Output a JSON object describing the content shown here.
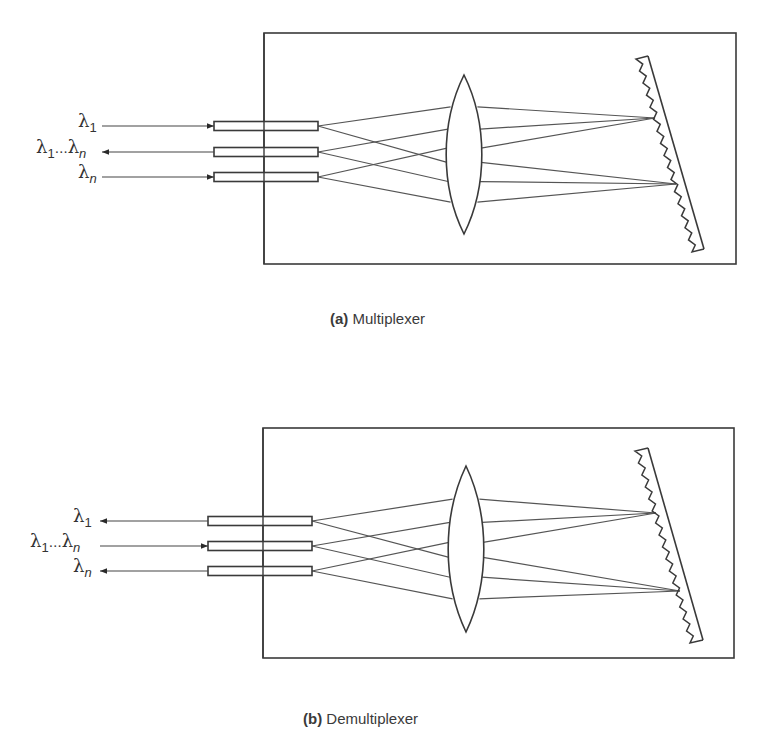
{
  "panels": [
    {
      "id": "a",
      "caption_letter": "(a)",
      "caption_text": "Multiplexer",
      "box": {
        "x": 264,
        "y": 33,
        "w": 472,
        "h": 231
      },
      "fiber": {
        "x1": 214,
        "x2": 318,
        "h": 9,
        "ys": [
          126,
          152,
          177
        ]
      },
      "center_line_x": 264,
      "lens": {
        "cx": 464,
        "top": 75,
        "bottom": 234,
        "half_w": 18
      },
      "grating": {
        "back": [
          [
            648,
            56
          ],
          [
            704,
            249
          ]
        ],
        "front": [
          [
            636,
            59
          ],
          [
            692,
            252
          ]
        ],
        "teeth": 16
      },
      "focus_points": [
        [
          655,
          118
        ],
        [
          676,
          184
        ]
      ],
      "ports": [
        {
          "label": "λ",
          "sub": "1",
          "sub2": "",
          "y": 126,
          "direction": "in"
        },
        {
          "label": "λ",
          "sub": "1",
          "sub2": "n",
          "y": 152,
          "direction": "out"
        },
        {
          "label": "λ",
          "sub": "n",
          "sub2": "",
          "y": 177,
          "direction": "in"
        }
      ],
      "arrow_x1": 102
    },
    {
      "id": "b",
      "caption_letter": "(b)",
      "caption_text": "Demultiplexer",
      "box": {
        "x": 263,
        "y": 428,
        "w": 471,
        "h": 230
      },
      "fiber": {
        "x1": 208,
        "x2": 312,
        "h": 9,
        "ys": [
          521,
          546,
          571
        ]
      },
      "center_line_x": 263,
      "lens": {
        "cx": 466,
        "top": 466,
        "bottom": 632,
        "half_w": 18
      },
      "grating": {
        "back": [
          [
            648,
            448
          ],
          [
            703,
            640
          ]
        ],
        "front": [
          [
            635,
            451
          ],
          [
            690,
            643
          ]
        ],
        "teeth": 16
      },
      "focus_points": [
        [
          656,
          513
        ],
        [
          680,
          591
        ]
      ],
      "ports": [
        {
          "label": "λ",
          "sub": "1",
          "sub2": "",
          "y": 521,
          "direction": "out"
        },
        {
          "label": "λ",
          "sub": "1",
          "sub2": "n",
          "y": 546,
          "direction": "in"
        },
        {
          "label": "λ",
          "sub": "n",
          "sub2": "",
          "y": 571,
          "direction": "out"
        }
      ],
      "arrow_x1": 100
    }
  ],
  "captions": {
    "a": {
      "letter": "(a)",
      "text": "Multiplexer"
    },
    "b": {
      "letter": "(b)",
      "text": "Demultiplexer"
    }
  },
  "labels": {
    "lambda": "λ",
    "one": "1",
    "n": "n",
    "dots": "…"
  },
  "colors": {
    "stroke": "#3a3a3a",
    "ray": "#555555",
    "background": "#ffffff"
  }
}
